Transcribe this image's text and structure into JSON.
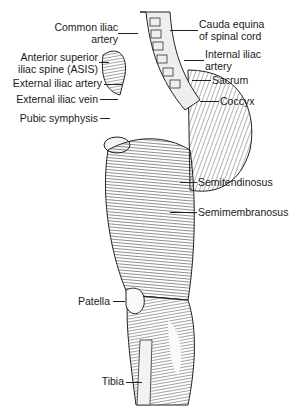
{
  "figure": {
    "labels_left": [
      {
        "id": "common-iliac-artery",
        "lines": [
          "Common iliac",
          "artery"
        ]
      },
      {
        "id": "asis",
        "lines": [
          "Anterior superior",
          "iliac spine (ASIS)"
        ]
      },
      {
        "id": "external-iliac-artery",
        "lines": [
          "External iliac artery"
        ]
      },
      {
        "id": "external-iliac-vein",
        "lines": [
          "External iliac vein"
        ]
      },
      {
        "id": "pubic-symphysis",
        "lines": [
          "Pubic symphysis"
        ]
      },
      {
        "id": "patella",
        "lines": [
          "Patella"
        ]
      },
      {
        "id": "tibia",
        "lines": [
          "Tibia"
        ]
      }
    ],
    "labels_right": [
      {
        "id": "cauda-equina",
        "lines": [
          "Cauda equina",
          "of spinal cord"
        ]
      },
      {
        "id": "internal-iliac-artery",
        "lines": [
          "Internal iliac",
          "artery"
        ]
      },
      {
        "id": "sacrum",
        "lines": [
          "Sacrum"
        ]
      },
      {
        "id": "coccyx",
        "lines": [
          "Coccyx"
        ]
      },
      {
        "id": "semitendinosus",
        "lines": [
          "Semitendinosus"
        ]
      },
      {
        "id": "semimembranosus",
        "lines": [
          "Semimembranosus"
        ]
      }
    ]
  }
}
